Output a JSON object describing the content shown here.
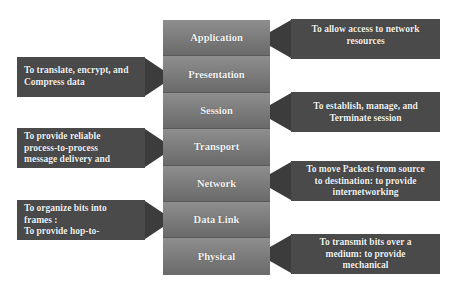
{
  "diagram": {
    "colors": {
      "layer_fill": "#7f7f7f",
      "callout_fill": "#4a4a4a",
      "callout_arrow": "#3c3c3c",
      "text": "#f2f2f2"
    },
    "layers": [
      {
        "name": "Application"
      },
      {
        "name": "Presentation"
      },
      {
        "name": "Session"
      },
      {
        "name": "Transport"
      },
      {
        "name": "Network"
      },
      {
        "name": "Data Link"
      },
      {
        "name": "Physical"
      }
    ],
    "callouts": [
      {
        "layer": "Application",
        "side": "right",
        "lines": [
          "To allow access to network",
          "resources"
        ]
      },
      {
        "layer": "Presentation",
        "side": "left",
        "lines": [
          "To translate, encrypt, and",
          "Compress data"
        ]
      },
      {
        "layer": "Session",
        "side": "right",
        "lines": [
          "To establish, manage, and",
          "Terminate session"
        ]
      },
      {
        "layer": "Transport",
        "side": "left",
        "lines": [
          "To provide reliable",
          "process-to-process",
          "message delivery and"
        ]
      },
      {
        "layer": "Network",
        "side": "right",
        "lines": [
          "To move Packets from source",
          "to destination: to provide",
          "internetworking"
        ]
      },
      {
        "layer": "Data Link",
        "side": "left",
        "lines": [
          "To organize bits into",
          "frames :",
          "To provide hop-to-"
        ]
      },
      {
        "layer": "Physical",
        "side": "right",
        "lines": [
          "To transmit bits over a",
          "medium: to provide",
          "mechanical"
        ]
      }
    ]
  }
}
